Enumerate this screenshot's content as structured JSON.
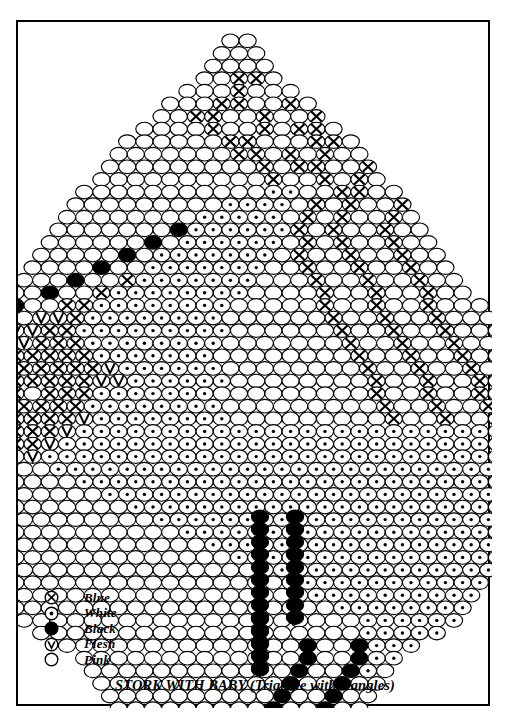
{
  "document": {
    "caption": "STORK WITH BABY (Triangle with Dangles)",
    "page_number": "59"
  },
  "legend": {
    "title": "Bead Color Key",
    "items": [
      {
        "symbol": "circle-x",
        "label": "Blue",
        "color": "#ffffff",
        "marker": "x"
      },
      {
        "symbol": "circle-dot",
        "label": "White",
        "color": "#ffffff",
        "marker": "dot"
      },
      {
        "symbol": "circle-filled",
        "label": "Black",
        "color": "#000000",
        "marker": "none"
      },
      {
        "symbol": "circle-v",
        "label": "Flesh",
        "color": "#ffffff",
        "marker": "v"
      },
      {
        "symbol": "circle-open",
        "label": "Pink",
        "color": "#ffffff",
        "marker": "none"
      }
    ]
  },
  "chart_data": {
    "type": "grid",
    "title": "STORK WITH BABY (Triangle with Dangles)",
    "bead_width": 17.2,
    "bead_height": 13.6,
    "row_pitch": 12.6,
    "origin_x": 237,
    "origin_y": 32,
    "symbols": {
      "P": "Pink",
      "W": "White",
      "B": "Blue",
      "K": "Black",
      "F": "Flesh"
    },
    "colors": {
      "P": "#ffffff",
      "W": "#ffffff",
      "B": "#ffffff",
      "K": "#000000",
      "F": "#ffffff"
    },
    "rows": [
      "PP",
      "PPP",
      "PPPP",
      "PPBBP",
      "PPPBPPP",
      "PPPBBPPBP",
      "PPBBPPBPPB",
      "PPPPBPPBPBBP",
      "PPPPPPBBPPPBBP",
      "PPPPPPPBBPBPBPP",
      "PPPPPPPPPBPBBPPB",
      "PPPPPPPPPPBPPBPBP",
      "PPPPPPPPPPPWWPPBBPP",
      "PPPPPPPPPWWWWPBPBPPB",
      "PPPPPPPPWWWWWPBPBPPBP",
      "PPPPPPPKWWWWWWBPBPPBPP",
      "PPPPPPKPWWWWWWPBPBPPBPP",
      "PPPPPKPWWWWWWWPBPPBPPBPP",
      "PPPPKPPWWWWWWWPPBPPBPPBPP",
      "PPPKPPBWWWWWWWPPPBPPBPPBPP",
      "PPKPPBWWWWWWWWPPPPBPPBPPBPP",
      "PKPPBBWWWWWWWWPPPPPBPPBPPBPPP",
      "KPPFFBWWWWWWWWPPPPPPBPPBPPBPPP",
      "PPFFBBWWWWWWWWWPPPPPPBPPBPPBPPP",
      "PPFFBBBWWWWWWWWPPPPPPPBPPBPPBPPP",
      "PPPBBBBBWWWWWWWPPPPPPPPBPPBPPBPPP",
      "PPPBBBBBBFWWWWWWPPPPPPPPBPPBPPBPPP",
      "PPPBBBBBBFFWWWWWWPPPPPPPPBPPBPPBPPP",
      "PPPPBBPBBBWWWWWWWPPPPPPPPPBPPBPPBPPPP",
      "PPPPBBBBBBWWWWWWWWPPPPPPPPPBPPBPPBPPPP",
      "PPPPBBBBBBFWWWWWWWWPPPPPPPPPBPPBPPBPPPP",
      "PPPPPBBBBFWWWWWWWWWWWWWWWWWWWWWWWWWWWWW",
      "PPPPPPBBFWWWWWWWWWWWWWWWWWWWWWWWWWWWWWW",
      "PPPPPPPFWWWWWWWWWWWWWWWWWWWWWWWWWWWWWWW",
      "PPPPPPPPWWWWWWWWWWWWWWWWWWWWWWWWWWWWWW",
      "PPPPPPPPPWWWWWWWWWWWWWWWWWWWWWWWWWWWW",
      "PPPPPPPPPPWWWWWWWWWWWWWWWWWWWWWWWWWW",
      "PPPPPPPPPPPWWWWWWWWWWWWWWWWWWWWWWWW",
      "PPPPPPPPPPPPWWWWWWWWWWWWWWWWWWWWWW",
      "PPPPPPPPPPPPPWWWWWWWWWWWWWWWWWWWW",
      "PPPPPPPPPPPPPPWWWWWWWWWWWWWWWWWW",
      "PPPPPPPPPPPPPPPWWWWWWWWWWWWWWWW",
      "PPPPPPPPPPPPPPPPWWWWWWWWWWWWWW",
      "PPPPPPPPPPPPPPPPPWWWWWWWWWWWW",
      "PPPPPPPPPPPPPPPPPPWWWWWWWWWW",
      "PPPPPPPPPPPPPPPPPPPWWWWWWWW",
      "PPPPPPPPPPPPPPPPPPPPWWWWWW",
      "PPPPPPPPPPPPPPPPPPPWWWWW",
      "PPPPPPPPPPPPPPKPPKWWW",
      "PPPPPPPPPPPPPKPPKWW",
      "PPPPPPPPPPPPKPPKWP",
      "PPPPPPPPPPPKPPKPP",
      "PPPPPPPPPPKPPKPP",
      "PPPPPPPPPKPPKPP",
      "PPPPPPPPKPPKPP",
      "PPPPPPPKPPKPP",
      "PPPPPPKPPKPP",
      "PPPPPKPPKPP",
      "PPPPKPPKPP",
      "PPPKPPKPP",
      "PPKPPKPP",
      "PKPPKPP",
      "KPPKPP"
    ],
    "dangles": [
      {
        "name": "dangle-left",
        "x": 258,
        "y_start": 508,
        "length": 13,
        "color": "K"
      },
      {
        "name": "dangle-right",
        "x": 293,
        "y_start": 508,
        "length": 9,
        "color": "K"
      },
      {
        "name": "dangle-tail",
        "x": 258,
        "y_start": 610,
        "length": 5,
        "color": "K"
      }
    ]
  }
}
